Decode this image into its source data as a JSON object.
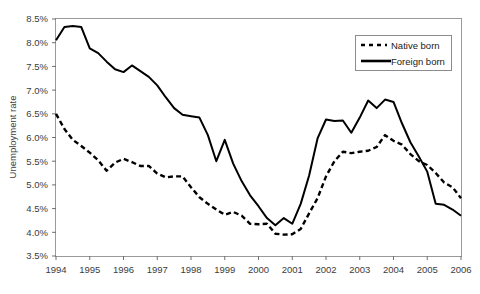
{
  "chart_data": {
    "type": "line",
    "title": "",
    "xlabel": "",
    "ylabel": "Unemployment rate",
    "ylim": [
      3.5,
      8.5
    ],
    "ytick_labels": [
      "3.5%",
      "4.0%",
      "4.5%",
      "5.0%",
      "5.5%",
      "6.0%",
      "6.5%",
      "7.0%",
      "7.5%",
      "8.0%",
      "8.5%"
    ],
    "ytick_values": [
      3.5,
      4.0,
      4.5,
      5.0,
      5.5,
      6.0,
      6.5,
      7.0,
      7.5,
      8.0,
      8.5
    ],
    "xtick_labels": [
      "1994",
      "1995",
      "1996",
      "1997",
      "1998",
      "1999",
      "2000",
      "2001",
      "2002",
      "2003",
      "2004",
      "2005",
      "2006"
    ],
    "xtick_values": [
      1994,
      1995,
      1996,
      1997,
      1998,
      1999,
      2000,
      2001,
      2002,
      2003,
      2004,
      2005,
      2006
    ],
    "xlim": [
      1994,
      2006
    ],
    "grid": false,
    "legend_position": "top-right",
    "frequency": "quarterly",
    "x": [
      1994.0,
      1994.25,
      1994.5,
      1994.75,
      1995.0,
      1995.25,
      1995.5,
      1995.75,
      1996.0,
      1996.25,
      1996.5,
      1996.75,
      1997.0,
      1997.25,
      1997.5,
      1997.75,
      1998.0,
      1998.25,
      1998.5,
      1998.75,
      1999.0,
      1999.25,
      1999.5,
      1999.75,
      2000.0,
      2000.25,
      2000.5,
      2000.75,
      2001.0,
      2001.25,
      2001.5,
      2001.75,
      2002.0,
      2002.25,
      2002.5,
      2002.75,
      2003.0,
      2003.25,
      2003.5,
      2003.75,
      2004.0,
      2004.25,
      2004.5,
      2004.75,
      2005.0,
      2005.25,
      2005.5,
      2005.75,
      2006.0
    ],
    "series": [
      {
        "name": "Native born",
        "style": "dashed",
        "color": "#000000",
        "values": [
          6.5,
          6.18,
          5.95,
          5.82,
          5.68,
          5.52,
          5.3,
          5.47,
          5.55,
          5.48,
          5.4,
          5.4,
          5.24,
          5.16,
          5.18,
          5.18,
          4.95,
          4.74,
          4.6,
          4.48,
          4.37,
          4.43,
          4.35,
          4.18,
          4.17,
          4.18,
          3.97,
          3.95,
          3.96,
          4.07,
          4.4,
          4.72,
          5.18,
          5.5,
          5.7,
          5.67,
          5.7,
          5.72,
          5.8,
          6.05,
          5.93,
          5.85,
          5.65,
          5.5,
          5.42,
          5.25,
          5.05,
          4.95,
          4.72
        ]
      },
      {
        "name": "Foreign born",
        "style": "solid",
        "color": "#000000",
        "values": [
          8.05,
          8.33,
          8.35,
          8.33,
          7.88,
          7.78,
          7.6,
          7.44,
          7.38,
          7.52,
          7.4,
          7.28,
          7.1,
          6.85,
          6.62,
          6.48,
          6.45,
          6.42,
          6.05,
          5.5,
          5.95,
          5.45,
          5.08,
          4.78,
          4.55,
          4.3,
          4.15,
          4.3,
          4.18,
          4.6,
          5.2,
          5.98,
          6.38,
          6.35,
          6.36,
          6.1,
          6.42,
          6.78,
          6.62,
          6.8,
          6.75,
          6.3,
          5.9,
          5.6,
          5.28,
          4.6,
          4.58,
          4.48,
          4.35
        ]
      }
    ]
  },
  "legend": {
    "items": [
      {
        "label": "Native born",
        "style": "dashed"
      },
      {
        "label": "Foreign born",
        "style": "solid"
      }
    ]
  },
  "axes": {
    "y_axis_title": "Unemployment rate"
  }
}
